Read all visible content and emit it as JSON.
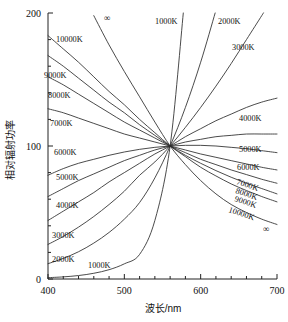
{
  "chart_data": {
    "type": "line",
    "title": "",
    "xlabel": "波长/nm",
    "ylabel": "相对辐射功率",
    "xlim": [
      400,
      700
    ],
    "ylim": [
      0,
      200
    ],
    "xticks": [
      "400",
      "500",
      "600",
      "700"
    ],
    "xtick_values": [
      400,
      500,
      600,
      700
    ],
    "yticks": [
      "0",
      "100",
      "200"
    ],
    "ytick_values": [
      0,
      100,
      200
    ],
    "grid": false,
    "legend": "inline-curve-labels",
    "normalization_point": {
      "x": 560,
      "y": 100
    },
    "x": [
      400,
      420,
      440,
      460,
      480,
      500,
      520,
      540,
      560,
      580,
      600,
      620,
      640,
      660,
      680,
      700
    ],
    "series": [
      {
        "name": "1000K",
        "label": "1000K",
        "values": [
          1.0,
          1.6,
          2.6,
          4.3,
          7.0,
          11.4,
          18.5,
          44.0,
          100.0,
          216.0,
          430.0,
          700.0,
          1050.0,
          1480.0,
          1980.0,
          2540.0
        ]
      },
      {
        "name": "2000K",
        "label": "2000K",
        "values": [
          11.5,
          15.5,
          20.5,
          27.0,
          35.0,
          45.0,
          57.5,
          76.0,
          100.0,
          129.0,
          163.0,
          202.0,
          246.0,
          294.0,
          346.0,
          400.0
        ]
      },
      {
        "name": "3000K",
        "label": "3000K",
        "values": [
          26.0,
          32.0,
          39.0,
          47.0,
          56.0,
          66.0,
          78.0,
          88.0,
          100.0,
          114.0,
          129.0,
          145.0,
          162.0,
          180.0,
          198.0,
          217.0
        ]
      },
      {
        "name": "4000K",
        "label": "4000K",
        "values": [
          44.0,
          51.0,
          58.0,
          65.0,
          73.0,
          80.0,
          87.0,
          94.0,
          100.0,
          107.0,
          113.0,
          119.0,
          124.0,
          129.0,
          133.0,
          136.0
        ]
      },
      {
        "name": "5000K",
        "label": "5000K",
        "values": [
          62.0,
          68.0,
          74.0,
          79.0,
          84.0,
          89.0,
          93.0,
          97.0,
          100.0,
          103.0,
          105.0,
          107.0,
          108.0,
          109.0,
          109.0,
          109.0
        ]
      },
      {
        "name": "6000K",
        "label": "6000K",
        "values": [
          78.0,
          83.0,
          87.0,
          90.0,
          93.0,
          95.5,
          97.5,
          99.0,
          100.0,
          100.5,
          100.5,
          100.0,
          99.0,
          98.0,
          96.5,
          95.0
        ]
      },
      {
        "name": "7000K",
        "label": "7000K",
        "values": [
          128.0,
          125.0,
          121.0,
          117.0,
          113.0,
          109.0,
          106.0,
          103.0,
          100.0,
          97.0,
          94.0,
          91.5,
          89.0,
          86.5,
          84.0,
          82.0
        ]
      },
      {
        "name": "8000K",
        "label": "8000K",
        "values": [
          152.0,
          146.0,
          139.0,
          132.0,
          125.0,
          118.0,
          112.0,
          106.0,
          100.0,
          95.0,
          90.0,
          86.0,
          82.0,
          78.5,
          75.0,
          72.0
        ]
      },
      {
        "name": "9000K",
        "label": "9000K",
        "values": [
          168.0,
          160.0,
          151.0,
          142.0,
          133.0,
          125.0,
          116.0,
          108.0,
          100.0,
          93.0,
          87.0,
          81.5,
          76.5,
          72.0,
          68.0,
          64.0
        ]
      },
      {
        "name": "10000K",
        "label": "10000K",
        "values": [
          183.0,
          173.0,
          163.0,
          152.0,
          141.0,
          131.0,
          120.0,
          110.0,
          100.0,
          92.0,
          84.0,
          77.5,
          71.5,
          66.5,
          62.0,
          58.0
        ]
      },
      {
        "name": "infinity-upper",
        "label": "∞",
        "values": [
          null,
          null,
          null,
          198.0,
          176.0,
          156.0,
          137.0,
          118.0,
          100.0,
          86.0,
          74.0,
          64.0,
          56.0,
          50.0,
          45.0,
          41.0
        ]
      }
    ],
    "annotations": [
      {
        "text": "10000K",
        "series": "10000K",
        "side": "left"
      },
      {
        "text": "9000K",
        "series": "9000K",
        "side": "left"
      },
      {
        "text": "8000K",
        "series": "8000K",
        "side": "left"
      },
      {
        "text": "7000K",
        "series": "7000K",
        "side": "left"
      },
      {
        "text": "6000K",
        "series": "6000K",
        "side": "left"
      },
      {
        "text": "5000K",
        "series": "5000K",
        "side": "left"
      },
      {
        "text": "4000K",
        "series": "4000K",
        "side": "left"
      },
      {
        "text": "3000K",
        "series": "3000K",
        "side": "left"
      },
      {
        "text": "2000K",
        "series": "2000K",
        "side": "left"
      },
      {
        "text": "1000K",
        "series": "1000K",
        "side": "bottom"
      },
      {
        "text": "∞",
        "series": "infinity-upper",
        "side": "top-left"
      },
      {
        "text": "1000K",
        "series": "1000K",
        "side": "top"
      },
      {
        "text": "2000K",
        "series": "2000K",
        "side": "top"
      },
      {
        "text": "3000K",
        "series": "3000K",
        "side": "top-right"
      },
      {
        "text": "4000K",
        "series": "4000K",
        "side": "right"
      },
      {
        "text": "5000K",
        "series": "5000K",
        "side": "right"
      },
      {
        "text": "6000K",
        "series": "6000K",
        "side": "right"
      },
      {
        "text": "7000K",
        "series": "7000K",
        "side": "right-tilted"
      },
      {
        "text": "8000K",
        "series": "8000K",
        "side": "right-tilted"
      },
      {
        "text": "9000K",
        "series": "9000K",
        "side": "right-tilted"
      },
      {
        "text": "10000K",
        "series": "10000K",
        "side": "right-tilted"
      },
      {
        "text": "∞",
        "series": "infinity-upper",
        "side": "bottom-right"
      }
    ]
  },
  "labels": {
    "x_axis_title": "波长/nm",
    "y_axis_title": "相对辐射功率",
    "x_tick_400": "400",
    "x_tick_500": "500",
    "x_tick_600": "600",
    "x_tick_700": "700",
    "y_tick_0": "0",
    "y_tick_100": "100",
    "y_tick_200": "200",
    "k1000": "1000K",
    "k2000": "2000K",
    "k3000": "3000K",
    "k4000": "4000K",
    "k5000": "5000K",
    "k6000": "6000K",
    "k7000": "7000K",
    "k8000": "8000K",
    "k9000": "9000K",
    "k10000": "10000K",
    "infinity": "∞"
  },
  "colors": {
    "curve": "#2a2a2a",
    "axis": "#222222",
    "text": "#111111",
    "background": "#ffffff"
  }
}
